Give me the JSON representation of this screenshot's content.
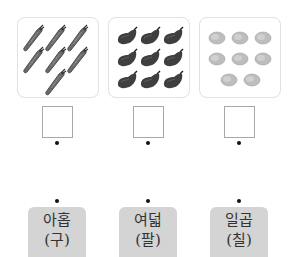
{
  "cards": [
    {
      "item": "carrot",
      "count": 7,
      "color": "#5a5a5a"
    },
    {
      "item": "eggplant",
      "count": 9,
      "color": "#3c3c3c"
    },
    {
      "item": "round-item",
      "count": 8,
      "color": "#bdbdbd"
    }
  ],
  "answer_boxes": [
    {
      "value": ""
    },
    {
      "value": ""
    },
    {
      "value": ""
    }
  ],
  "labels": [
    {
      "native": "아홉",
      "sino": "(구)"
    },
    {
      "native": "여덟",
      "sino": "(팔)"
    },
    {
      "native": "일곱",
      "sino": "(칠)"
    }
  ],
  "colors": {
    "label_bg": "#d4d4d4",
    "card_border": "#e2e2e2",
    "box_border": "#a8a8a8"
  }
}
